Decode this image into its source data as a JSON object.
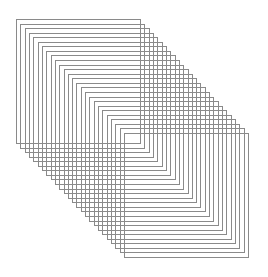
{
  "artwork": {
    "description": "Stacked cascade of outlined squares offset diagonally from top-left to bottom-right",
    "shape": "square",
    "count": 26,
    "stroke_color": "#8a8a8a",
    "background_color": "#ffffff",
    "fill": "none"
  }
}
